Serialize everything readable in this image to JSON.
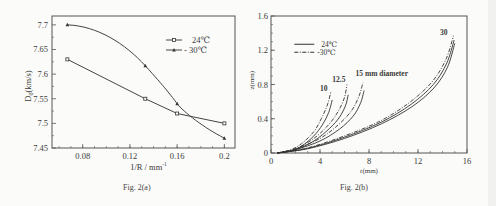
{
  "chart_data": [
    {
      "type": "line",
      "id": "fig2a",
      "title": "",
      "caption": "Fig. 2(a)",
      "xlabel": "1/R / mm",
      "xlabel_sup": "-1",
      "ylabel": "D",
      "ylabel_sub": "0",
      "ylabel_unit": "(km/s)",
      "xlim": [
        0.054,
        0.209
      ],
      "ylim": [
        7.45,
        7.718
      ],
      "xticks": [
        0.08,
        0.12,
        0.16,
        0.2
      ],
      "xtick_labels": [
        "0.08",
        "0.12",
        "0.16",
        "0.2"
      ],
      "yticks": [
        7.45,
        7.5,
        7.55,
        7.6,
        7.65,
        7.7
      ],
      "ytick_labels": [
        "7.45",
        "7.5",
        "7.55",
        "7.6",
        "7.65",
        "7.7"
      ],
      "grid": false,
      "legend_position": "upper right",
      "x": [
        0.067,
        0.133,
        0.16,
        0.2
      ],
      "series": [
        {
          "name": "24℃",
          "marker": "square",
          "values": [
            7.63,
            7.55,
            7.52,
            7.5
          ]
        },
        {
          "name": "- 30℃",
          "marker": "triangle",
          "values": [
            7.7,
            7.617,
            7.54,
            7.47
          ]
        }
      ]
    },
    {
      "type": "line",
      "id": "fig2b",
      "title": "",
      "caption": "Fig. 2(b)",
      "xlabel": "r(mm)",
      "ylabel": "z(mm)",
      "xlim": [
        0,
        16
      ],
      "ylim": [
        0,
        1.6
      ],
      "xticks": [
        0,
        4,
        8,
        12,
        16
      ],
      "xtick_labels": [
        "0",
        "4",
        "8",
        "12",
        "16"
      ],
      "yticks": [
        0,
        0.4,
        0.8,
        1.2,
        1.6
      ],
      "ytick_labels": [
        "0",
        "0.4",
        "0.8",
        "1.2",
        "1.6"
      ],
      "grid": false,
      "legend_position": "upper left",
      "legend": [
        {
          "name": "24℃",
          "style": "solid"
        },
        {
          "name": "-30℃",
          "style": "dash-dot"
        }
      ],
      "annotations": [
        "10",
        "12.5",
        "15 mm diameter",
        "30"
      ],
      "series": [
        {
          "name": "10 mm, 24℃",
          "style": "solid",
          "x": [
            0.5,
            1.5,
            2.5,
            3.5,
            4.2,
            4.7,
            5.0
          ],
          "y": [
            0,
            0.02,
            0.08,
            0.2,
            0.33,
            0.47,
            0.62
          ]
        },
        {
          "name": "10 mm, -30℃",
          "style": "dash-dot",
          "x": [
            0.5,
            1.5,
            2.5,
            3.5,
            4.1,
            4.6,
            4.9
          ],
          "y": [
            0,
            0.03,
            0.11,
            0.25,
            0.4,
            0.56,
            0.72
          ]
        },
        {
          "name": "12.5 mm, 24℃",
          "style": "solid",
          "x": [
            0.5,
            2,
            3.5,
            4.8,
            5.6,
            6.1,
            6.3
          ],
          "y": [
            0,
            0.04,
            0.14,
            0.29,
            0.42,
            0.56,
            0.68
          ]
        },
        {
          "name": "12.5 mm, -30℃",
          "style": "dash-dot",
          "x": [
            0.5,
            2,
            3.5,
            4.7,
            5.5,
            6.0,
            6.2
          ],
          "y": [
            0,
            0.05,
            0.17,
            0.33,
            0.49,
            0.65,
            0.8
          ]
        },
        {
          "name": "15 mm, 24℃",
          "style": "solid",
          "x": [
            0.5,
            2,
            4,
            5.6,
            6.7,
            7.3,
            7.6
          ],
          "y": [
            0,
            0.04,
            0.14,
            0.28,
            0.43,
            0.58,
            0.73
          ]
        },
        {
          "name": "15 mm, -30℃",
          "style": "dash-dot",
          "x": [
            0.5,
            2,
            4,
            5.5,
            6.6,
            7.2,
            7.5
          ],
          "y": [
            0,
            0.05,
            0.17,
            0.33,
            0.5,
            0.67,
            0.82
          ]
        },
        {
          "name": "30 mm, 24℃",
          "style": "solid",
          "x": [
            0.5,
            3,
            6,
            9,
            11.5,
            13.3,
            14.4,
            15.0
          ],
          "y": [
            0,
            0.05,
            0.17,
            0.34,
            0.54,
            0.76,
            1.0,
            1.28
          ]
        },
        {
          "name": "30 mm, -30℃",
          "style": "dash-dot",
          "x": [
            0.5,
            3,
            6,
            9,
            11.4,
            13.2,
            14.3,
            14.9
          ],
          "y": [
            0,
            0.06,
            0.2,
            0.38,
            0.6,
            0.84,
            1.1,
            1.37
          ]
        },
        {
          "name": "30 mm, middle",
          "style": "solid",
          "x": [
            0.5,
            3,
            6,
            9,
            11.45,
            13.25,
            14.35,
            14.95
          ],
          "y": [
            0,
            0.055,
            0.185,
            0.36,
            0.57,
            0.8,
            1.05,
            1.32
          ]
        }
      ]
    }
  ]
}
